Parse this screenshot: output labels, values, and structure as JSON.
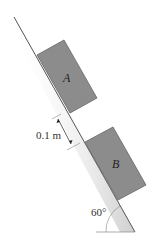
{
  "diagram": {
    "type": "inclined plane with two blocks",
    "blocks": [
      {
        "label": "A",
        "color": "#8c8c8c"
      },
      {
        "label": "B",
        "color": "#8c8c8c"
      }
    ],
    "spacing_label": "0.1 m",
    "angle_label": "60°",
    "incline_color": "#555555"
  }
}
